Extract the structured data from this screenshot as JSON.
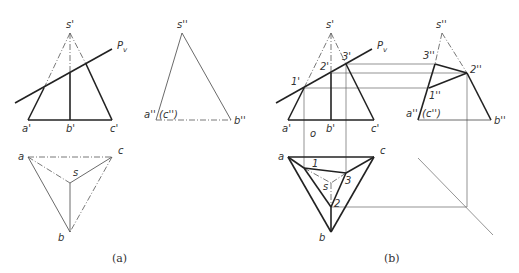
{
  "figure_a": {
    "caption": "(a)",
    "front_view": {
      "labels": {
        "s": "s'",
        "a": "a'",
        "b": "b'",
        "c": "c'",
        "plane": "P",
        "plane_sub": "v"
      }
    },
    "side_view": {
      "labels": {
        "s": "s''",
        "a": "a''",
        "c": "(c'')",
        "b": "b''"
      }
    },
    "top_view": {
      "labels": {
        "a": "a",
        "b": "b",
        "c": "c",
        "s": "s"
      }
    }
  },
  "figure_b": {
    "caption": "(b)",
    "front_view": {
      "labels": {
        "s": "s'",
        "a": "a'",
        "b": "b'",
        "c": "c'",
        "p1": "1'",
        "p2": "2'",
        "p3": "3'",
        "plane": "P",
        "plane_sub": "v",
        "marker": "o"
      }
    },
    "side_view": {
      "labels": {
        "s": "s''",
        "a": "a''",
        "c": "(c'')",
        "b": "b''",
        "p1": "1''",
        "p2": "2''",
        "p3": "3''"
      }
    },
    "top_view": {
      "labels": {
        "a": "a",
        "b": "b",
        "c": "c",
        "s": "s",
        "p1": "1",
        "p2": "2",
        "p3": "3"
      }
    }
  }
}
